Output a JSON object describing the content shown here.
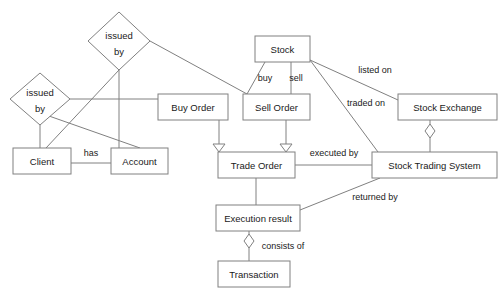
{
  "diagram": {
    "background_color": "#ffffff",
    "line_color": "#808080",
    "text_color": "#1a1a1a",
    "entities": [
      {
        "id": "client",
        "label": "Client",
        "x": 13,
        "y": 148,
        "w": 58,
        "h": 26
      },
      {
        "id": "account",
        "label": "Account",
        "x": 111,
        "y": 148,
        "w": 57,
        "h": 26
      },
      {
        "id": "stock",
        "label": "Stock",
        "x": 255,
        "y": 36,
        "w": 55,
        "h": 26
      },
      {
        "id": "buy_order",
        "label": "Buy Order",
        "x": 158,
        "y": 94,
        "w": 70,
        "h": 26
      },
      {
        "id": "sell_order",
        "label": "Sell Order",
        "x": 243,
        "y": 94,
        "w": 67,
        "h": 26
      },
      {
        "id": "stock_exchange",
        "label": "Stock Exchange",
        "x": 398,
        "y": 94,
        "w": 99,
        "h": 26
      },
      {
        "id": "trade_order",
        "label": "Trade Order",
        "x": 218,
        "y": 152,
        "w": 77,
        "h": 26
      },
      {
        "id": "sts",
        "label": "Stock Trading System",
        "x": 372,
        "y": 152,
        "w": 125,
        "h": 26
      },
      {
        "id": "exec_result",
        "label": "Execution result",
        "x": 216,
        "y": 205,
        "w": 84,
        "h": 26
      },
      {
        "id": "transaction",
        "label": "Transaction",
        "x": 218,
        "y": 261,
        "w": 72,
        "h": 26
      }
    ],
    "relationships": [
      {
        "id": "issued_by_top",
        "label_line1": "issued",
        "label_line2": "by",
        "cx": 119,
        "cy": 41,
        "rx": 31,
        "ry": 29
      },
      {
        "id": "issued_by_left",
        "label_line1": "issued",
        "label_line2": "by",
        "cx": 40,
        "cy": 99,
        "rx": 30,
        "ry": 26
      }
    ],
    "edge_labels": [
      {
        "id": "buy",
        "text": "buy",
        "x": 265,
        "y": 79
      },
      {
        "id": "sell",
        "text": "sell",
        "x": 296,
        "y": 79
      },
      {
        "id": "listed_on",
        "text": "listed on",
        "x": 375,
        "y": 71
      },
      {
        "id": "traded_on",
        "text": "traded on",
        "x": 366,
        "y": 104
      },
      {
        "id": "has",
        "text": "has",
        "x": 91,
        "y": 154
      },
      {
        "id": "executed_by",
        "text": "executed by",
        "x": 334,
        "y": 154
      },
      {
        "id": "returned_by",
        "text": "returned by",
        "x": 375,
        "y": 198
      },
      {
        "id": "consists_of",
        "text": "consists of",
        "x": 283,
        "y": 247
      }
    ],
    "connections": [
      {
        "id": "stock-buy-order",
        "from": "stock",
        "to": "buy_order",
        "kind": "line"
      },
      {
        "id": "stock-sell-order",
        "from": "stock",
        "to": "sell_order",
        "kind": "line"
      },
      {
        "id": "stock-stock-exchange",
        "from": "stock",
        "to": "stock_exchange",
        "kind": "line"
      },
      {
        "id": "stock-sts",
        "from": "stock",
        "to": "sts",
        "kind": "line"
      },
      {
        "id": "buy-order-trade-order",
        "from": "buy_order",
        "to": "trade_order",
        "kind": "generalization"
      },
      {
        "id": "sell-order-trade-order",
        "from": "sell_order",
        "to": "trade_order",
        "kind": "generalization"
      },
      {
        "id": "trade-order-sts",
        "from": "trade_order",
        "to": "sts",
        "kind": "line"
      },
      {
        "id": "trade-order-exec",
        "from": "trade_order",
        "to": "exec_result",
        "kind": "line"
      },
      {
        "id": "sts-exec",
        "from": "sts",
        "to": "exec_result",
        "kind": "line"
      },
      {
        "id": "exchange-sts",
        "from": "stock_exchange",
        "to": "sts",
        "kind": "aggregation"
      },
      {
        "id": "exec-transaction",
        "from": "exec_result",
        "to": "transaction",
        "kind": "aggregation"
      },
      {
        "id": "client-account",
        "from": "client",
        "to": "account",
        "kind": "line"
      },
      {
        "id": "issued-top-client",
        "from": "issued_by_top",
        "to": "client",
        "kind": "line"
      },
      {
        "id": "issued-top-account",
        "from": "issued_by_top",
        "to": "account",
        "kind": "line"
      },
      {
        "id": "issued-top-sell",
        "from": "issued_by_top",
        "to": "sell_order",
        "kind": "line"
      },
      {
        "id": "issued-left-client",
        "from": "issued_by_left",
        "to": "client",
        "kind": "line"
      },
      {
        "id": "issued-left-buy",
        "from": "issued_by_left",
        "to": "buy_order",
        "kind": "line"
      },
      {
        "id": "issued-left-account",
        "from": "issued_by_left",
        "to": "account",
        "kind": "line"
      }
    ]
  }
}
